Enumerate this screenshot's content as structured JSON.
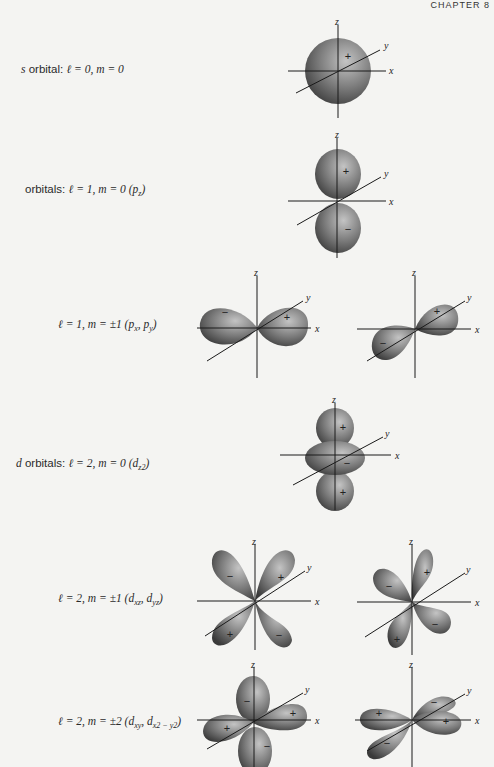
{
  "header": {
    "text": "CHAPTER 8"
  },
  "rows": [
    {
      "id": "s",
      "prefix": "s",
      "text": " orbital: ",
      "l": "ℓ = 0, ",
      "m": "m = 0",
      "sub": ""
    },
    {
      "id": "pz",
      "prefix": "",
      "text": "orbitals: ",
      "l": "ℓ = 1, ",
      "m": "m = 0 ",
      "sub": "(p_z)"
    },
    {
      "id": "pxpy",
      "prefix": "",
      "text": "",
      "l": "ℓ = 1, ",
      "m": "m = ±1 ",
      "sub": "(p_x, p_y)"
    },
    {
      "id": "dz2",
      "prefix": "d",
      "text": " orbitals: ",
      "l": "ℓ = 2, ",
      "m": "m = 0 ",
      "sub": "(d_z2)"
    },
    {
      "id": "dxz",
      "prefix": "",
      "text": "",
      "l": "ℓ = 2, ",
      "m": "m = ±1 ",
      "sub": "(d_xz, d_yz)"
    },
    {
      "id": "dxy",
      "prefix": "",
      "text": "",
      "l": "ℓ = 2, ",
      "m": "m = ±2 ",
      "sub": "(d_xy, d_x2−y2)"
    }
  ],
  "axes": {
    "x": "x",
    "y": "y",
    "z": "z"
  },
  "signs": {
    "plus": "+",
    "minus": "−"
  },
  "colors": {
    "lobe_light": "#b8b8b8",
    "lobe_dark": "#3e3e3e",
    "background": "#f4f4f2"
  }
}
